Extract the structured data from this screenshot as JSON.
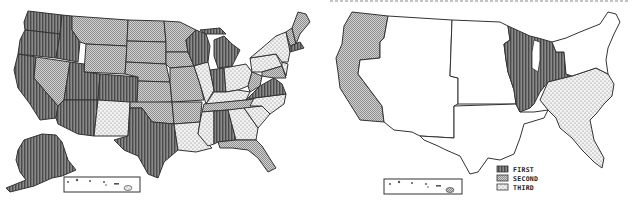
{
  "figure": {
    "title_cut_off": true,
    "maps": [
      {
        "id": "left",
        "description": "US states shaded by rank category",
        "regions": {
          "first": [
            "Washington",
            "Oregon",
            "California",
            "Idaho",
            "Utah",
            "Arizona",
            "Colorado",
            "Texas",
            "Alaska",
            "Wisconsin",
            "Michigan",
            "Indiana",
            "Virginia",
            "Alabama",
            "Massachusetts",
            "Connecticut"
          ],
          "second": [
            "Montana",
            "Wyoming",
            "Nevada",
            "North Dakota",
            "South Dakota",
            "Nebraska",
            "Kansas",
            "Oklahoma",
            "Minnesota",
            "Iowa",
            "Missouri",
            "Arkansas",
            "Tennessee",
            "Florida",
            "Vermont",
            "New Hampshire",
            "Maine",
            "Maryland",
            "West Virginia"
          ],
          "third": [
            "New Mexico",
            "Illinois",
            "Ohio",
            "Kentucky",
            "Louisiana",
            "Mississippi",
            "Georgia",
            "South Carolina",
            "North Carolina",
            "Pennsylvania",
            "New York",
            "New Jersey",
            "Delaware",
            "Hawaii"
          ]
        }
      },
      {
        "id": "right",
        "description": "US regions shaded by rank category",
        "regions": {
          "first": [
            "Great Lakes (WI, MI, IL, IN, OH)"
          ],
          "second": [
            "Pacific (WA, OR, CA)",
            "Alaska"
          ],
          "third": [
            "Southeast Atlantic (VA, NC, SC, GA, FL)"
          ],
          "unshaded": [
            "Mountain",
            "Plains",
            "South Central",
            "Northeast",
            "Hawaii"
          ]
        }
      }
    ],
    "legend": {
      "items": [
        {
          "key": "first",
          "label": "FIRST",
          "pattern": "vertical-hatch-dark"
        },
        {
          "key": "second",
          "label": "SECOND",
          "pattern": "crosshatch-grey"
        },
        {
          "key": "third",
          "label": "THIRD",
          "pattern": "dotted-light"
        }
      ]
    },
    "colors": {
      "first": "#6e6e6e",
      "second": "#b8b8b8",
      "third": "#ececec",
      "none": "#ffffff",
      "stroke": "#333333"
    }
  }
}
